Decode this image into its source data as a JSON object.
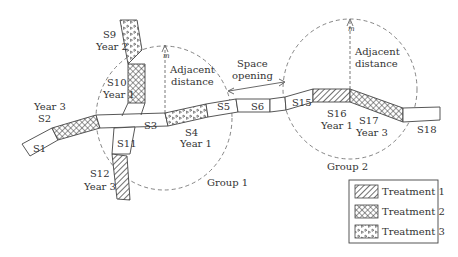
{
  "segments": {
    "s1": "S1",
    "s2": "S2",
    "s2_year": "Year 3",
    "s3": "S3",
    "s4": "S4",
    "s4_year": "Year 1",
    "s5": "S5",
    "s6": "S6",
    "s9": "S9",
    "s9_year": "Year 2",
    "s10": "S10",
    "s10_year": "Year 1",
    "s11": "S11",
    "s12": "S12",
    "s12_year": "Year 3",
    "s15": "S15",
    "s16": "S16",
    "s16_year": "Year 1",
    "s17": "S17",
    "s17_year": "Year 3",
    "s18": "S18"
  },
  "annotations": {
    "adjacent_distance_1_line1": "Adjacent",
    "adjacent_distance_1_line2": "distance",
    "adjacent_distance_2_line1": "Adjacent",
    "adjacent_distance_2_line2": "distance",
    "space_opening_line1": "Space",
    "space_opening_line2": "opening",
    "m_symbol_1": "m",
    "m_symbol_2": "m",
    "group1": "Group 1",
    "group2": "Group 2"
  },
  "legend": {
    "items": [
      {
        "label": "Treatment 1",
        "pattern": "diagonal-hatch"
      },
      {
        "label": "Treatment 2",
        "pattern": "cross-hatch"
      },
      {
        "label": "Treatment 3",
        "pattern": "triangles"
      }
    ]
  }
}
